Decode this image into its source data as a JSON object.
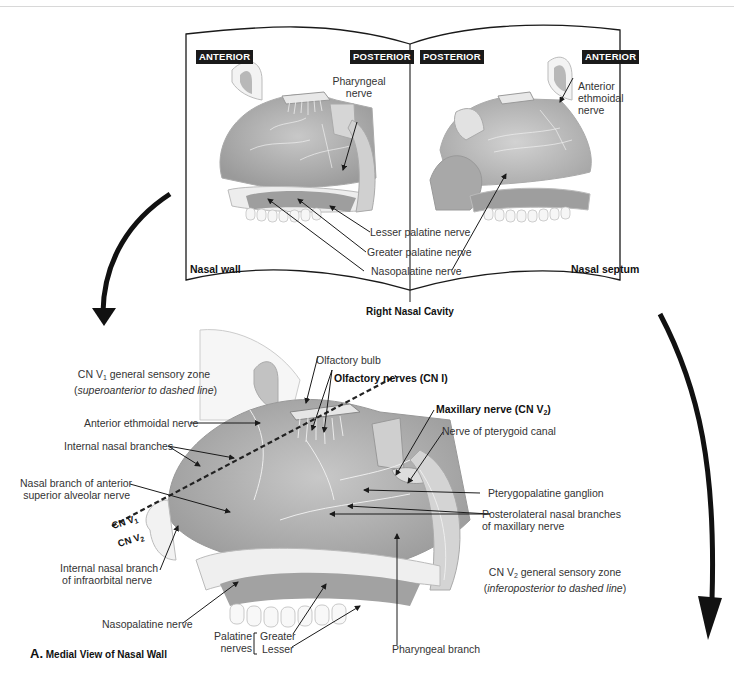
{
  "panel_top": {
    "title": "Right Nasal Cavity",
    "left": {
      "caption": "Nasal wall",
      "tags": [
        "ANTERIOR",
        "POSTERIOR"
      ],
      "labels": {
        "pharyngeal": [
          "Pharyngeal",
          "nerve"
        ]
      }
    },
    "right": {
      "caption": "Nasal septum",
      "tags": [
        "POSTERIOR",
        "ANTERIOR"
      ],
      "labels": {
        "anterior_ethmoidal": [
          "Anterior",
          "ethmoidal",
          "nerve"
        ]
      }
    },
    "shared_labels": [
      "Lesser palatine nerve",
      "Greater palatine nerve",
      "Nasopalatine nerve"
    ]
  },
  "panel_bottom": {
    "figure_letter": "A.",
    "figure_title": "Medial View of Nasal Wall",
    "zone_v1": {
      "title_pre": "CN V",
      "sub": "1",
      "title_post": " general sensory zone",
      "note_open": "(",
      "note_italic": "superoanterior to dashed line",
      "note_close": ")"
    },
    "zone_v2": {
      "title_pre": "CN V",
      "sub": "2",
      "title_post": " general sensory zone",
      "note_open": "(",
      "note_italic": "inferoposterior to dashed line",
      "note_close": ")"
    },
    "dash_labels": {
      "v1_pre": "CN V",
      "v1_sub": "1",
      "v2_pre": "CN V",
      "v2_sub": "2"
    },
    "labels": {
      "olfactory_bulb": "Olfactory bulb",
      "olfactory_nerves": "Olfactory nerves (CN I)",
      "maxillary_pre": "Maxillary nerve (CN V",
      "maxillary_sub": "2",
      "maxillary_post": ")",
      "pterygoid_canal": "Nerve of pterygoid canal",
      "anterior_ethmoidal": "Anterior ethmoidal nerve",
      "internal_nasal": "Internal nasal branches",
      "nasal_branch_asa": [
        "Nasal branch of anterior",
        "superior alveolar nerve"
      ],
      "pterygopalatine": "Pterygopalatine ganglion",
      "posterolateral": [
        "Posterolateral nasal branches",
        "of maxillary nerve"
      ],
      "internal_nasal_infraorbital": [
        "Internal nasal branch",
        "of infraorbital nerve"
      ],
      "nasopalatine": "Nasopalatine nerve",
      "palatine_nerves": [
        "Palatine",
        "nerves"
      ],
      "palatine_greater": "Greater",
      "palatine_lesser": "Lesser",
      "pharyngeal_branch": "Pharyngeal branch"
    }
  },
  "colors": {
    "ink": "#1a1a1a",
    "tissue": "#bdbdbd",
    "tissue_light": "#e2e2e2",
    "bone": "#f1f1f1"
  }
}
